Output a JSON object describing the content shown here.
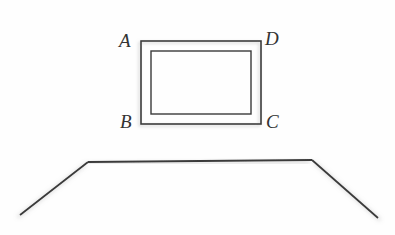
{
  "figure": {
    "kind": "line-drawing",
    "background_color": "#fefefe",
    "line_color": "#3a3a3a",
    "shadow_color": "#b9b9b9",
    "width": 395,
    "height": 235
  },
  "room": {
    "left_wall_edge": {
      "x1": 88,
      "y1": 12,
      "x2": 88,
      "y2": 162
    },
    "right_wall_edge": {
      "x1": 312,
      "y1": 12,
      "x2": 312,
      "y2": 160
    },
    "floor_back_edge": {
      "x1": 88,
      "y1": 162,
      "x2": 312,
      "y2": 160
    },
    "floor_left_diagonal": {
      "x1": 88,
      "y1": 162,
      "x2": 20,
      "y2": 215
    },
    "floor_right_diagonal": {
      "x1": 312,
      "y1": 160,
      "x2": 378,
      "y2": 218
    }
  },
  "frame": {
    "outer_rect": {
      "x": 141,
      "y": 41,
      "width": 120,
      "height": 83
    },
    "inner_rect": {
      "x": 151,
      "y": 51,
      "width": 100,
      "height": 63
    },
    "stroke_width": 1.6
  },
  "labels": {
    "top_left": "A",
    "top_right": "D",
    "bottom_left": "B",
    "bottom_right": "C"
  }
}
